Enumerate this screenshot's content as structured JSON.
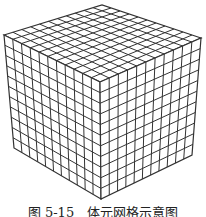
{
  "figure": {
    "caption": "图 5-15　体元网格示意图",
    "grid_divisions": 11,
    "line_color": "#333333",
    "face_color": "#ffffff",
    "vertices": {
      "top_back": [
        102,
        5
      ],
      "top_left": [
        4,
        35
      ],
      "top_right": [
        201,
        38
      ],
      "top_front": [
        100,
        82
      ],
      "bottom_left": [
        14,
        148
      ],
      "bottom_right": [
        192,
        155
      ],
      "bottom_front": [
        101,
        199
      ]
    }
  }
}
